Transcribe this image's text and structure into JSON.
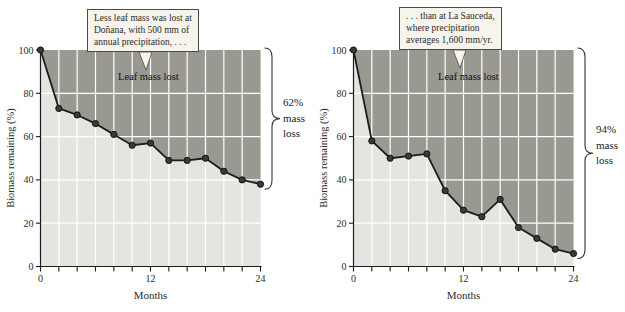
{
  "colors": {
    "dark_fill": "#999991",
    "light_fill": "#e4e4e0",
    "grid": "#ffffff",
    "line": "#1c1c1c",
    "marker_fill": "#3a3a3a",
    "marker_edge": "#111111",
    "axis": "#1c1c1c",
    "brace": "#333333",
    "callout_bg": "#f6f4ed",
    "callout_border": "#4a4a4a",
    "text": "#2b2b2b"
  },
  "chart_data": [
    {
      "type": "area",
      "site": "Doñana",
      "x": [
        0,
        2,
        4,
        6,
        8,
        10,
        12,
        14,
        16,
        18,
        20,
        22,
        24
      ],
      "series": [
        {
          "name": "Biomass remaining",
          "values": [
            100,
            73,
            70,
            66,
            61,
            56,
            57,
            49,
            49,
            50,
            44,
            40,
            38
          ]
        }
      ],
      "xlabel": "Months",
      "ylabel": "Biomass remaining (%)",
      "xlim": [
        0,
        24
      ],
      "ylim": [
        0,
        100
      ],
      "xticks": [
        0,
        12,
        24
      ],
      "xminortick_step": 2,
      "yticks": [
        0,
        20,
        40,
        60,
        80,
        100
      ],
      "grid": true,
      "area_label": "Leaf mass lost",
      "annotation_lines": [
        "Less leaf mass was lost at",
        "Doñana, with 500 mm of",
        "annual precipitation, . . ."
      ],
      "brace_label_lines": [
        "62%",
        "mass",
        "loss"
      ],
      "brace_label": "62% mass loss"
    },
    {
      "type": "area",
      "site": "La Sauceda",
      "x": [
        0,
        2,
        4,
        6,
        8,
        10,
        12,
        14,
        16,
        18,
        20,
        22,
        24
      ],
      "series": [
        {
          "name": "Biomass remaining",
          "values": [
            100,
            58,
            50,
            51,
            52,
            35,
            26,
            23,
            31,
            18,
            13,
            8,
            6
          ]
        }
      ],
      "xlabel": "Months",
      "ylabel": "Biomass remaining (%)",
      "xlim": [
        0,
        24
      ],
      "ylim": [
        0,
        100
      ],
      "xticks": [
        0,
        12,
        24
      ],
      "xminortick_step": 2,
      "yticks": [
        0,
        20,
        40,
        60,
        80,
        100
      ],
      "grid": true,
      "area_label": "Leaf mass lost",
      "annotation_lines": [
        ". . . than at La Sauceda,",
        "where precipitation",
        "averages 1,600 mm/yr."
      ],
      "brace_label_lines": [
        "94%",
        "mass",
        "loss"
      ],
      "brace_label": "94% mass loss"
    }
  ]
}
